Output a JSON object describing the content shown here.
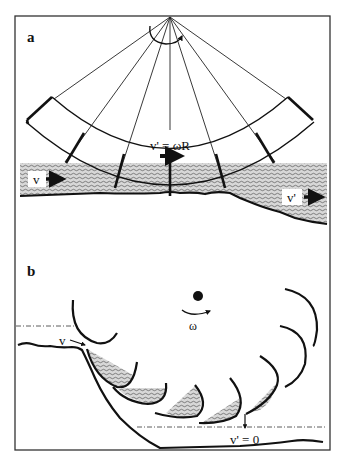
{
  "figure": {
    "panels": [
      {
        "id": "a",
        "letter": "a",
        "description": "Undershot water wheel with radial blades dipping into flowing stream",
        "labels": {
          "inflow_velocity": "v",
          "blade_velocity": "v' = ωR",
          "outflow_velocity": "v'"
        }
      },
      {
        "id": "b",
        "letter": "b",
        "description": "Overshot water wheel with curved buckets filled with water descending past the weir",
        "labels": {
          "inflow_velocity": "v",
          "angular_velocity": "ω",
          "outflow_velocity": "v' = 0"
        }
      }
    ],
    "colors": {
      "stroke": "#111111",
      "water_fill": "#bdbdbd",
      "background": "#ffffff",
      "frame": "#333333"
    }
  }
}
